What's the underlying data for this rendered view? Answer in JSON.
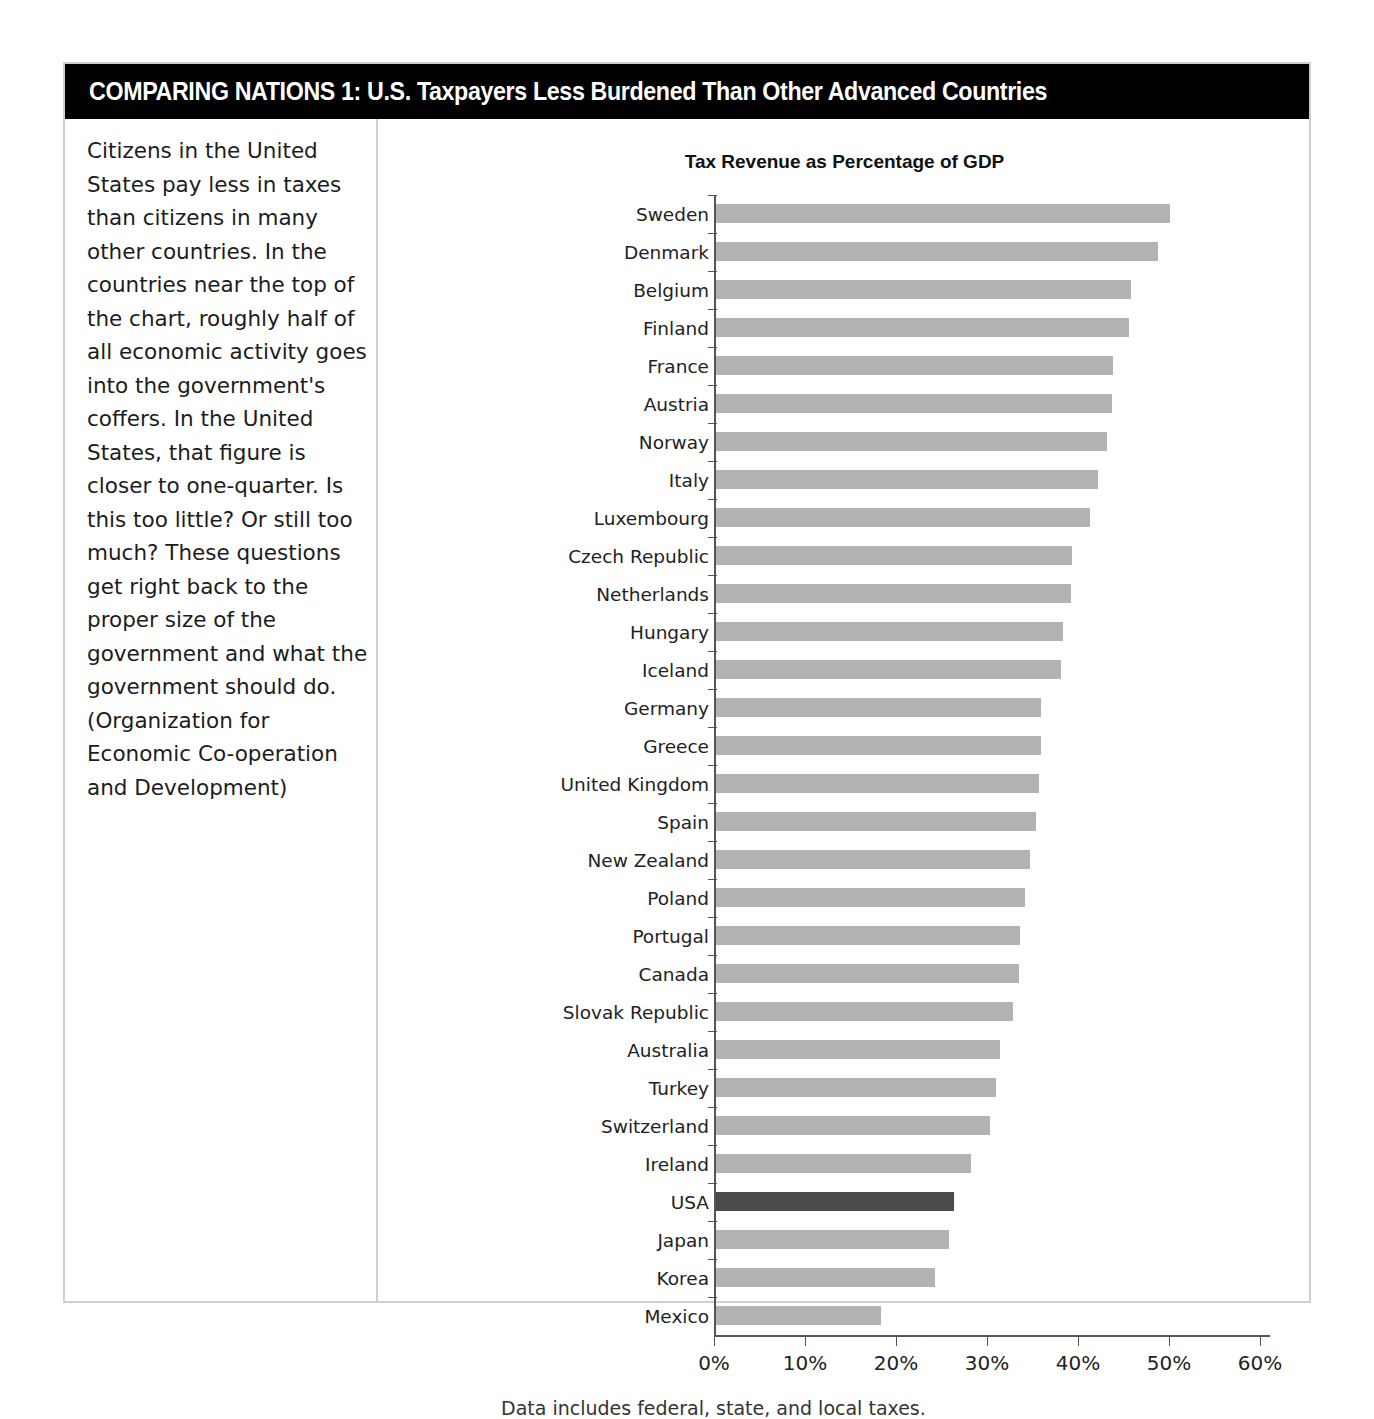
{
  "header": {
    "title": "COMPARING NATIONS 1: U.S. Taxpayers Less Burdened Than Other Advanced Countries"
  },
  "sidebar": {
    "paragraph": "Citizens in the United States pay less in taxes than citizens in many other countries. In the countries near the top of the chart, roughly half of all economic activity goes into the government's coffers. In the United States, that figure is closer to one-quarter. Is this too little? Or still too much? These questions get right back to the proper size of the government and what the government should do.",
    "source": "(Organization for Economic Co-operation and Development)"
  },
  "footnote": "Data includes federal, state, and local taxes.",
  "colors": {
    "bar": "#b3b3b3",
    "highlight": "#4a4a4a",
    "title_bg": "#000000",
    "frame": "#cfcfcf"
  },
  "chart_data": {
    "type": "bar",
    "orientation": "horizontal",
    "title": "Tax Revenue as Percentage of GDP",
    "xlabel": "",
    "ylabel": "",
    "xlim": [
      0,
      60
    ],
    "xticks": [
      0,
      10,
      20,
      30,
      40,
      50,
      60
    ],
    "xticklabels": [
      "0%",
      "10%",
      "20%",
      "30%",
      "40%",
      "50%",
      "60%"
    ],
    "grid": false,
    "legend": false,
    "highlight_category": "USA",
    "categories": [
      "Sweden",
      "Denmark",
      "Belgium",
      "Finland",
      "France",
      "Austria",
      "Norway",
      "Italy",
      "Luxembourg",
      "Czech Republic",
      "Netherlands",
      "Hungary",
      "Iceland",
      "Germany",
      "Greece",
      "United Kingdom",
      "Spain",
      "New Zealand",
      "Poland",
      "Portugal",
      "Canada",
      "Slovak Republic",
      "Australia",
      "Turkey",
      "Switzerland",
      "Ireland",
      "USA",
      "Japan",
      "Korea",
      "Mexico"
    ],
    "values": [
      50.1,
      48.8,
      45.8,
      45.6,
      43.8,
      43.7,
      43.2,
      42.2,
      41.3,
      39.3,
      39.2,
      38.4,
      38.1,
      35.9,
      35.9,
      35.7,
      35.4,
      34.7,
      34.2,
      33.6,
      33.5,
      32.9,
      31.4,
      31.0,
      30.3,
      28.2,
      26.4,
      25.8,
      24.3,
      18.4
    ],
    "unit": "%",
    "source_note": "Data includes federal, state, and local taxes."
  }
}
